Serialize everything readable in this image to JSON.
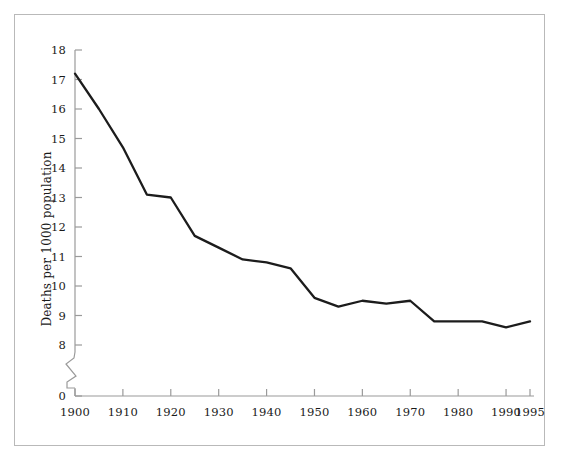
{
  "figure": {
    "background_color": "#ffffff",
    "frame_color": "#b9b9b9",
    "axis_color": "#9a9a9a",
    "line_color": "#1c1c1c"
  },
  "chart_data": {
    "type": "line",
    "title": "",
    "xlabel": "",
    "ylabel": "Deaths per 1000 population",
    "xlim": [
      1900,
      1995
    ],
    "ylim": [
      0,
      18
    ],
    "y_axis_break": {
      "present": true,
      "between": [
        0,
        8
      ],
      "note": "zigzag break symbol on y-axis between 0 and 8"
    },
    "grid": false,
    "legend": null,
    "xticks": [
      1900,
      1910,
      1920,
      1930,
      1940,
      1950,
      1960,
      1970,
      1980,
      1990,
      1995
    ],
    "xtick_labels": [
      "1900",
      "1910",
      "1920",
      "1930",
      "1940",
      "1950",
      "1960",
      "1970",
      "1980",
      "1990",
      "1995"
    ],
    "yticks": [
      0,
      8,
      9,
      10,
      11,
      12,
      13,
      14,
      15,
      16,
      17,
      18
    ],
    "ytick_labels": [
      "0",
      "8",
      "9",
      "10",
      "11",
      "12",
      "13",
      "14",
      "15",
      "16",
      "17",
      "18"
    ],
    "x": [
      1900,
      1905,
      1910,
      1915,
      1920,
      1925,
      1930,
      1935,
      1940,
      1945,
      1950,
      1955,
      1960,
      1965,
      1970,
      1975,
      1980,
      1985,
      1990,
      1995
    ],
    "values": [
      17.2,
      16.0,
      14.7,
      13.1,
      13.0,
      11.7,
      11.3,
      10.9,
      10.8,
      10.6,
      9.6,
      9.3,
      9.5,
      9.4,
      9.5,
      8.8,
      8.8,
      8.8,
      8.6,
      8.8
    ],
    "series": [
      {
        "name": "Deaths per 1000 population",
        "values": [
          17.2,
          16.0,
          14.7,
          13.1,
          13.0,
          11.7,
          11.3,
          10.9,
          10.8,
          10.6,
          9.6,
          9.3,
          9.5,
          9.4,
          9.5,
          8.8,
          8.8,
          8.8,
          8.6,
          8.8
        ]
      }
    ]
  }
}
